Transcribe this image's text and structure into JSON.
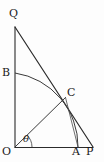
{
  "figure": {
    "kind": "geometry-diagram",
    "width": 104,
    "height": 162,
    "background_color": "#fdfdfd",
    "stroke_color": "#2b2b2b",
    "arc_color": "#3a3a3a",
    "label_color": "#1a1a1a"
  },
  "points": {
    "O": {
      "label": "O",
      "x": 15,
      "y": 147,
      "label_x": 3,
      "label_y": 147
    },
    "Q": {
      "label": "Q",
      "x": 15,
      "y": 27,
      "label_x": 9,
      "label_y": 8
    },
    "P": {
      "label": "P",
      "x": 93,
      "y": 147,
      "label_x": 88,
      "label_y": 147
    },
    "A": {
      "label": "A",
      "x": 78,
      "y": 147,
      "label_x": 73,
      "label_y": 147
    },
    "B": {
      "label": "B",
      "x": 15,
      "y": 73,
      "label_x": 3,
      "label_y": 68
    },
    "C": {
      "label": "C",
      "x": 65,
      "y": 98,
      "label_x": 68,
      "label_y": 87
    }
  },
  "angle": {
    "symbol": "θ",
    "label_x": 23,
    "label_y": 134,
    "vertex": "O",
    "between": [
      "OP",
      "OC"
    ]
  },
  "segments": [
    {
      "name": "segment-OQ",
      "from": "O",
      "to": "Q"
    },
    {
      "name": "segment-OP",
      "from": "O",
      "to": "P"
    },
    {
      "name": "segment-QP",
      "from": "Q",
      "to": "P"
    },
    {
      "name": "segment-OC-ray",
      "from": "O",
      "to": "C"
    },
    {
      "name": "segment-CA",
      "from": "C",
      "to": "A"
    }
  ],
  "arcs": [
    {
      "name": "arc-BA",
      "from": "B",
      "to": "A",
      "center": "O",
      "radius": 74
    },
    {
      "name": "arc-theta",
      "center": "O",
      "radius": 16
    }
  ]
}
